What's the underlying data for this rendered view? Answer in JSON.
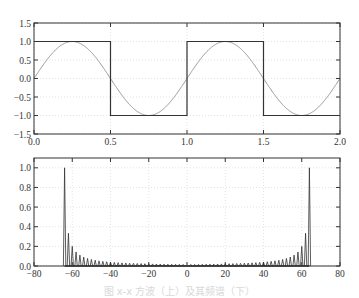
{
  "chart_data": [
    {
      "type": "line",
      "title": "",
      "xlabel": "",
      "ylabel": "",
      "xlim": [
        0.0,
        2.0
      ],
      "ylim": [
        -1.5,
        1.5
      ],
      "grid": true,
      "xticks": [
        "0.0",
        "0.5",
        "1.0",
        "1.5",
        "2.0"
      ],
      "yticks": [
        "1.5",
        "1.0",
        "0.5",
        "0.0",
        "-0.5",
        "-1.0",
        "-1.5"
      ],
      "series": [
        {
          "name": "square wave",
          "color": "#333333",
          "x": [
            0.0,
            0.5,
            0.5,
            1.0,
            1.0,
            1.5,
            1.5,
            2.0
          ],
          "y": [
            1,
            1,
            -1,
            -1,
            1,
            1,
            -1,
            -1
          ]
        },
        {
          "name": "sine wave",
          "color": "#9a9a9a",
          "function": "sin(2*pi*x)",
          "x_range": [
            0.0,
            2.0
          ]
        }
      ]
    },
    {
      "type": "bar",
      "title": "",
      "xlabel": "",
      "ylabel": "",
      "xlim": [
        -80,
        80
      ],
      "ylim": [
        0.0,
        1.1
      ],
      "grid": true,
      "xticks": [
        "-80",
        "-60",
        "-40",
        "-20",
        "0",
        "20",
        "40",
        "60",
        "80"
      ],
      "yticks": [
        "1.0",
        "0.8",
        "0.6",
        "0.4",
        "0.2",
        "0.0"
      ],
      "description": "Spectrum magnitudes with peaks at frequency ±64 decaying toward center",
      "peaks": [
        {
          "x": -64,
          "y": 1.0
        },
        {
          "x": -62,
          "y": 0.33
        },
        {
          "x": -60,
          "y": 0.2
        },
        {
          "x": -58,
          "y": 0.14
        },
        {
          "x": -56,
          "y": 0.11
        },
        {
          "x": -54,
          "y": 0.09
        },
        {
          "x": 62,
          "y": 0.33
        },
        {
          "x": 64,
          "y": 1.0
        }
      ]
    }
  ],
  "caption": "图 x-x  方波（上）及其频谱（下）"
}
